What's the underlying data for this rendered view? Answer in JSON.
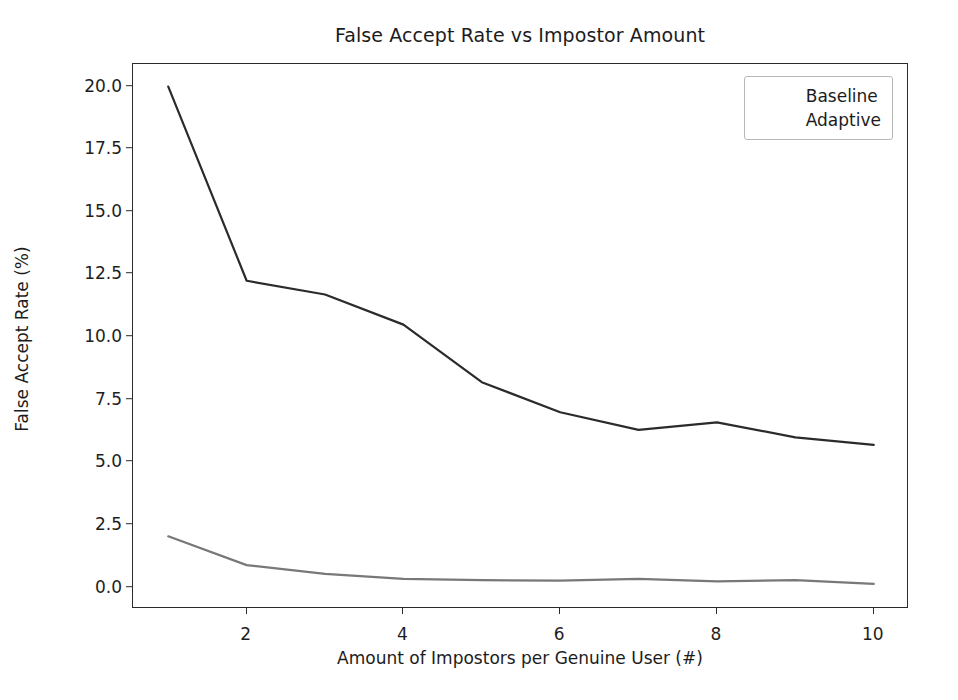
{
  "chart_data": {
    "type": "line",
    "title": "False Accept Rate vs Impostor Amount",
    "xlabel": "Amount of Impostors per Genuine User (#)",
    "ylabel": "False Accept Rate (%)",
    "x": [
      1,
      2,
      3,
      4,
      5,
      6,
      7,
      8,
      9,
      10
    ],
    "series": [
      {
        "name": "Baseline",
        "color": "#2b2b2b",
        "values": [
          20.0,
          12.25,
          11.7,
          10.5,
          8.2,
          7.0,
          6.3,
          6.6,
          6.0,
          5.7
        ]
      },
      {
        "name": "Adaptive",
        "color": "#787878",
        "values": [
          2.05,
          0.9,
          0.55,
          0.35,
          0.3,
          0.28,
          0.35,
          0.25,
          0.3,
          0.15
        ]
      }
    ],
    "xlim": [
      0.55,
      10.45
    ],
    "ylim": [
      -0.85,
      20.9
    ],
    "xticks": [
      2,
      4,
      6,
      8,
      10
    ],
    "xtick_labels": [
      "2",
      "4",
      "6",
      "8",
      "10"
    ],
    "yticks": [
      0.0,
      2.5,
      5.0,
      7.5,
      10.0,
      12.5,
      15.0,
      17.5,
      20.0
    ],
    "ytick_labels": [
      "0.0",
      "2.5",
      "5.0",
      "7.5",
      "10.0",
      "12.5",
      "15.0",
      "17.5",
      "20.0"
    ],
    "grid": false,
    "legend_position": "upper right",
    "background": "#ffffff",
    "line_width": 2.2
  }
}
